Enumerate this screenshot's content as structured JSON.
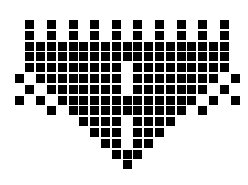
{
  "pattern": {
    "description": "Black pixel-square mosaic forming a shield/heart shape with a vertical gap in the center",
    "colors": {
      "foreground": "#000000",
      "background": "#ffffff"
    },
    "grid": {
      "origin_x": 14.5,
      "origin_y": 20,
      "pitch": 10.8,
      "cell_size": 9,
      "columns": 21,
      "rows": 14
    },
    "rows": [
      {
        "row": 0,
        "cells": [
          1,
          3,
          5,
          7,
          9,
          11,
          13,
          15,
          17,
          19
        ]
      },
      {
        "row": 1,
        "cells": [
          1,
          3,
          5,
          7,
          9,
          11,
          13,
          15,
          17,
          19
        ]
      },
      {
        "row": 2,
        "cells": [
          1,
          2,
          3,
          4,
          5,
          6,
          7,
          8,
          9,
          10,
          11,
          12,
          13,
          14,
          15,
          16,
          17,
          18,
          19
        ]
      },
      {
        "row": 3,
        "cells": [
          1,
          2,
          3,
          4,
          5,
          6,
          7,
          8,
          9,
          10,
          11,
          12,
          13,
          14,
          15,
          16,
          17,
          18,
          19
        ]
      },
      {
        "row": 4,
        "cells": [
          1,
          2,
          3,
          4,
          5,
          6,
          7,
          8,
          9,
          11,
          12,
          13,
          14,
          15,
          16,
          17,
          18,
          19
        ]
      },
      {
        "row": 5,
        "cells": [
          0,
          2,
          3,
          4,
          5,
          6,
          7,
          8,
          9,
          11,
          12,
          13,
          14,
          15,
          16,
          17,
          18,
          20
        ]
      },
      {
        "row": 6,
        "cells": [
          1,
          3,
          4,
          5,
          6,
          7,
          8,
          9,
          11,
          12,
          13,
          14,
          15,
          16,
          17,
          19
        ]
      },
      {
        "row": 7,
        "cells": [
          0,
          2,
          4,
          5,
          6,
          7,
          8,
          9,
          10,
          11,
          12,
          13,
          14,
          15,
          16,
          18,
          20
        ]
      },
      {
        "row": 8,
        "cells": [
          3,
          5,
          6,
          7,
          8,
          9,
          10,
          11,
          12,
          13,
          14,
          15,
          17
        ]
      },
      {
        "row": 9,
        "cells": [
          6,
          7,
          8,
          9,
          11,
          12,
          13,
          14
        ]
      },
      {
        "row": 10,
        "cells": [
          7,
          8,
          9,
          11,
          12,
          13
        ]
      },
      {
        "row": 11,
        "cells": [
          8,
          9,
          11,
          12
        ]
      },
      {
        "row": 12,
        "cells": [
          9,
          10,
          11
        ]
      },
      {
        "row": 13,
        "cells": [
          10
        ]
      }
    ]
  }
}
